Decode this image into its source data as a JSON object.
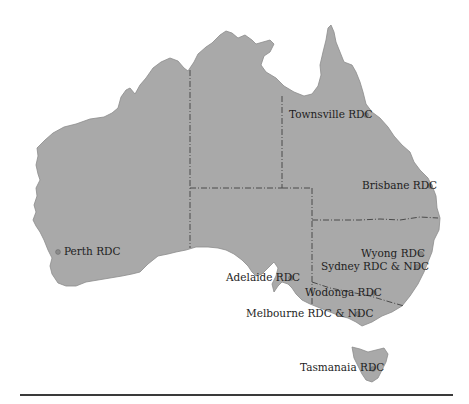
{
  "map": {
    "region": "Australia",
    "land_color": "#a9a9a9",
    "border_color": "#4a4a4a",
    "locations": [
      {
        "id": "townsville",
        "label": "Townsville RDC",
        "dot": [
          366,
          115
        ],
        "label_pos": [
          289,
          109
        ]
      },
      {
        "id": "brisbane",
        "label": "Brisbane RDC",
        "dot": [
          430,
          186
        ],
        "label_pos": [
          362,
          180
        ]
      },
      {
        "id": "perth",
        "label": "Perth RDC",
        "dot": [
          58,
          252
        ],
        "label_pos": [
          64,
          246
        ]
      },
      {
        "id": "wyong",
        "label": "Wyong RDC",
        "dot": [
          421,
          254
        ],
        "label_pos": [
          361,
          248
        ]
      },
      {
        "id": "sydney",
        "label": "Sydney RDC & NDC",
        "dot": [
          417,
          267
        ],
        "label_pos": [
          321,
          261
        ]
      },
      {
        "id": "adelaide",
        "label": "Adelaide RDC",
        "dot": [
          291,
          278
        ],
        "label_pos": [
          226,
          272
        ]
      },
      {
        "id": "wodonga",
        "label": "Wodonga RDC",
        "dot": [
          374,
          293
        ],
        "label_pos": [
          305,
          287
        ]
      },
      {
        "id": "melbourne",
        "label": "Melbourne RDC & NDC",
        "dot": [
          358,
          314
        ],
        "label_pos": [
          246,
          308
        ]
      },
      {
        "id": "tasmania",
        "label": "Tasmanaia RDC",
        "dot": [
          373,
          369
        ],
        "label_pos": [
          300,
          362
        ]
      }
    ]
  }
}
